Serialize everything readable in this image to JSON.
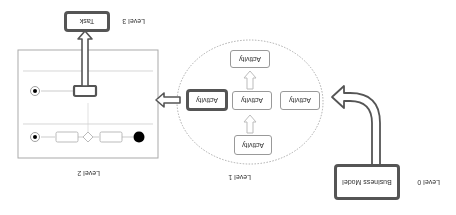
{
  "levels": {
    "level0": "Level 0",
    "level1": "Level 1",
    "level2": "Level 2",
    "level3": "Level 3"
  },
  "level0": {
    "box_label": "Business Model"
  },
  "level1": {
    "activities": [
      "Activity",
      "Activity",
      "Activity",
      "Activity",
      "Activity"
    ]
  },
  "level3": {
    "box_label": "Task"
  },
  "colors": {
    "bold_border": "#555555",
    "thin_border": "#999999",
    "dotted": "#aaaaaa"
  }
}
